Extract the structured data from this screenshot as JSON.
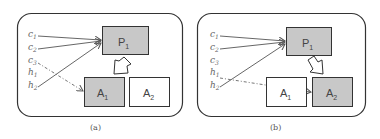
{
  "figure": {
    "colors": {
      "frame": "#333333",
      "box_filled": "#c8c8c8",
      "box_empty": "#ffffff",
      "box_border": "#333333",
      "arrow": "#555555",
      "dashed_arrow": "#666666"
    },
    "panels": [
      {
        "caption": "(a)",
        "inputs": [
          {
            "base": "c",
            "sub": "1"
          },
          {
            "base": "c",
            "sub": "2"
          },
          {
            "base": "c",
            "sub": "3"
          },
          {
            "base": "h",
            "sub": "1"
          },
          {
            "base": "h",
            "sub": "2"
          }
        ],
        "policy": {
          "base": "P",
          "sub": "1"
        },
        "actions": [
          {
            "base": "A",
            "sub": "1",
            "selected": true
          },
          {
            "base": "A",
            "sub": "2",
            "selected": false
          }
        ],
        "solid_edges": [
          "c1->P1",
          "c2->P1",
          "h2->P1"
        ],
        "dashed_edge": "c3->A1",
        "block_arrow": "P1->A1"
      },
      {
        "caption": "(b)",
        "inputs": [
          {
            "base": "c",
            "sub": "1"
          },
          {
            "base": "c",
            "sub": "2"
          },
          {
            "base": "c",
            "sub": "3"
          },
          {
            "base": "h",
            "sub": "1"
          },
          {
            "base": "h",
            "sub": "2"
          }
        ],
        "policy": {
          "base": "P",
          "sub": "1"
        },
        "actions": [
          {
            "base": "A",
            "sub": "1",
            "selected": false
          },
          {
            "base": "A",
            "sub": "2",
            "selected": true
          }
        ],
        "solid_edges": [
          "c1->P1",
          "c2->P1",
          "h2->P1"
        ],
        "dashed_edge": "h1->A2",
        "block_arrow": "P1->A2"
      }
    ]
  }
}
